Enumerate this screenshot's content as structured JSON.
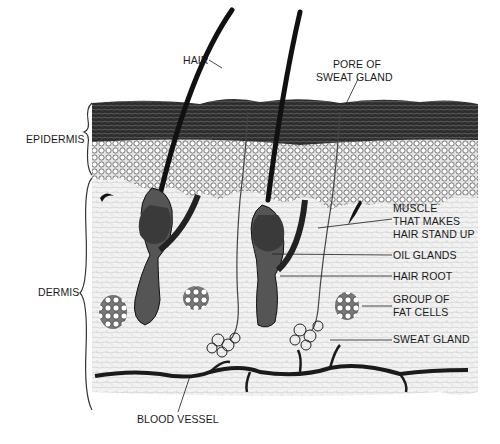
{
  "diagram": {
    "labels": {
      "hair": "HAIR",
      "pore_line1": "PORE OF",
      "pore_line2": "SWEAT GLAND",
      "epidermis": "EPIDERMIS",
      "dermis": "DERMIS",
      "muscle_line1": "MUSCLE",
      "muscle_line2": "THAT MAKES",
      "muscle_line3": "HAIR STAND UP",
      "oil_glands": "OIL GLANDS",
      "hair_root": "HAIR ROOT",
      "fat_line1": "GROUP OF",
      "fat_line2": "FAT CELLS",
      "sweat_gland": "SWEAT GLAND",
      "blood_vessel": "BLOOD VESSEL"
    },
    "colors": {
      "ink": "#1a1a1a",
      "epidermis_top": "#3a3a3a",
      "epidermis_cells": "#d8d8d8",
      "dermis": "#efefef"
    }
  }
}
